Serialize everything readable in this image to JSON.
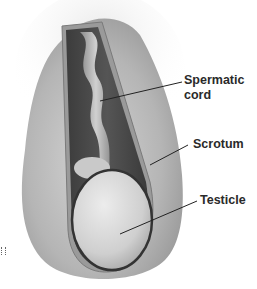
{
  "diagram": {
    "labels": [
      {
        "id": "spermatic-cord",
        "line1": "Spermatic",
        "line2": "cord"
      },
      {
        "id": "scrotum",
        "line1": "Scrotum"
      },
      {
        "id": "testicle",
        "line1": "Testicle"
      }
    ],
    "colors": {
      "skin": "#bdbdbd",
      "cavity": "#4a4a4a",
      "testicle": "#d8d8d8",
      "label_text": "#2a2a2a",
      "leader_line": "#222222"
    }
  }
}
